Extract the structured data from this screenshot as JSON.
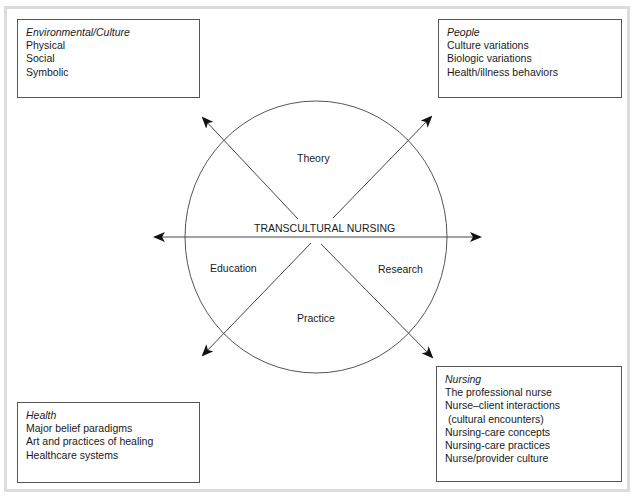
{
  "diagram": {
    "center_title": "TRANSCULTURAL NURSING",
    "quadrants": {
      "top": "Theory",
      "left": "Education",
      "right": "Research",
      "bottom": "Practice"
    },
    "boxes": {
      "top_left": {
        "title": "Environmental/Culture",
        "items": [
          "Physical",
          "Social",
          "Symbolic"
        ]
      },
      "top_right": {
        "title": "People",
        "items": [
          "Culture variations",
          "Biologic variations",
          "Health/illness behaviors"
        ]
      },
      "bottom_left": {
        "title": "Health",
        "items": [
          "Major belief paradigms",
          "Art and practices of healing",
          "Healthcare systems"
        ]
      },
      "bottom_right": {
        "title": "Nursing",
        "items": [
          "The professional nurse",
          "Nurse–client interactions",
          " (cultural encounters)",
          "Nursing-care concepts",
          "Nursing-care practices",
          "Nurse/provider culture"
        ]
      }
    },
    "colors": {
      "line": "#444444",
      "arrowhead": "#111111",
      "frame": "#dcdcdc",
      "box_border": "#555555"
    }
  }
}
